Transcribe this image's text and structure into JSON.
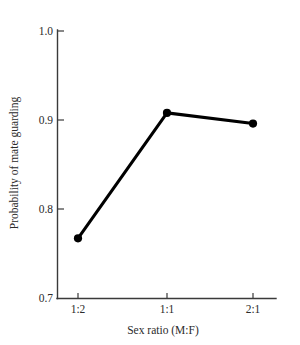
{
  "chart_data": {
    "type": "line",
    "title": "",
    "xlabel": "Sex ratio (M:F)",
    "ylabel": "Probability of mate guarding",
    "categories": [
      "1:2",
      "1:1",
      "2:1"
    ],
    "values": [
      0.767,
      0.908,
      0.896
    ],
    "series": [
      {
        "name": "Probability of mate guarding",
        "values": [
          0.767,
          0.908,
          0.896
        ]
      }
    ],
    "ylim": [
      0.7,
      1.0
    ],
    "yticks": [
      "0.7",
      "0.8",
      "0.9",
      "1.0"
    ],
    "ytick_values": [
      0.7,
      0.8,
      0.9,
      1.0
    ],
    "xticks": [
      "1:2",
      "1:1",
      "2:1"
    ],
    "grid": false,
    "legend": false,
    "legend_position": "none",
    "line_color": "#000000",
    "marker": "circle",
    "marker_color": "#000000",
    "axis_color": "#3a3a3a",
    "background_color": "#ffffff"
  },
  "labels": {
    "ytick_0": "0.7",
    "ytick_1": "0.8",
    "ytick_2": "0.9",
    "ytick_3": "1.0",
    "xtick_0": "1:2",
    "xtick_1": "1:1",
    "xtick_2": "2:1",
    "x_axis_title": "Sex ratio (M:F)",
    "y_axis_title": "Probability of mate guarding"
  }
}
